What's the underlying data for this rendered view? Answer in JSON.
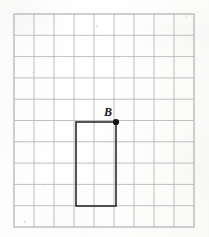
{
  "figure": {
    "background_color": "#fdfdfc"
  },
  "grid": {
    "columns": 9,
    "rows": 10,
    "left": 14,
    "top": 14,
    "right": 194,
    "bottom": 227,
    "cell_width": 20,
    "cell_height": 21.3,
    "line_color": "#b9b9b9",
    "line_width": 0.9,
    "border_color": "#b0b0b0"
  },
  "shape": {
    "name": "rectangle",
    "stroke_color": "#2b2b2b",
    "stroke_width": 1.6,
    "fill": "none",
    "left": 76,
    "top": 122,
    "right": 116,
    "bottom": 206,
    "width_cells": 2,
    "height_cells": 4
  },
  "point": {
    "label": "B",
    "x": 116,
    "y": 122,
    "radius": 3.1,
    "color": "#111111",
    "label_color": "#1c1c1c"
  },
  "speckles": [
    {
      "x": 54,
      "y": 22,
      "w": 1,
      "h": 3
    },
    {
      "x": 96,
      "y": 25,
      "w": 2,
      "h": 2
    },
    {
      "x": 32,
      "y": 72,
      "w": 1,
      "h": 1
    },
    {
      "x": 53,
      "y": 150,
      "w": 2,
      "h": 1
    },
    {
      "x": 44,
      "y": 184,
      "w": 1,
      "h": 2
    },
    {
      "x": 24,
      "y": 221,
      "w": 2,
      "h": 2
    },
    {
      "x": 186,
      "y": 15,
      "w": 1,
      "h": 3
    }
  ]
}
